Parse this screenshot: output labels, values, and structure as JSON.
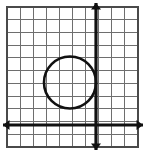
{
  "figure": {
    "width": 146,
    "height": 153,
    "background_color": "#ffffff"
  },
  "grid": {
    "label": "square grid",
    "left": 7,
    "top": 7,
    "right": 138,
    "bottom": 147,
    "columns": 10,
    "rows": 11,
    "cell_width": 13.1,
    "cell_height": 12.7,
    "line_color": "#6e6e6e",
    "border_color": "#4a4a4a",
    "show_grid": true
  },
  "axes": {
    "origin_x": 96,
    "origin_y": 125,
    "color": "#111111",
    "stroke_width": 3.2,
    "x_axis": {
      "label": "x-axis",
      "start_x": 3,
      "end_x": 143,
      "y": 125,
      "arrow_left": true,
      "arrow_right": true
    },
    "y_axis": {
      "label": "y-axis",
      "x": 96,
      "start_y": 3,
      "end_y": 150,
      "arrow_up": true,
      "arrow_down": true
    }
  },
  "chart_data": {
    "type": "scatter",
    "xlabel": "x",
    "ylabel": "y",
    "grid": true,
    "legend": "none",
    "xlim": [
      -7,
      3
    ],
    "ylim": [
      -2,
      9
    ],
    "shapes": [
      {
        "kind": "circle",
        "name": "circle",
        "center_px": [
          70,
          82.5
        ],
        "radius_px": 26,
        "center_units": [
          -2,
          3.3
        ],
        "radius_units": 2,
        "stroke": "#111111",
        "stroke_width": 2.6,
        "fill": "none",
        "tangent_to": "y-axis"
      }
    ]
  },
  "shape": {
    "name": "circle",
    "center_x": 70,
    "center_y": 82.5,
    "radius": 26,
    "stroke_color": "#111111",
    "fill": "none"
  }
}
